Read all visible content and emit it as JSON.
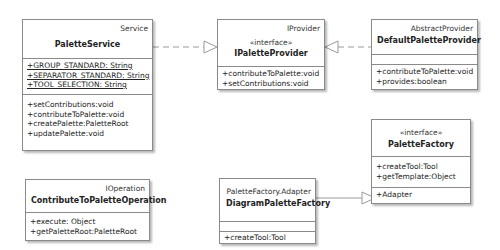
{
  "classes": {
    "palette_service": {
      "parent": "Service",
      "name": "PaletteService",
      "attributes": [
        "+GROUP_STANDARD: String",
        "+SEPARATOR_STANDARD: String",
        "+TOOL_SELECTION: String"
      ],
      "operations": [
        "+setContributions:void",
        "+contributeToPalette:void",
        "+createPalette:PaletteRoot",
        "+updatePalette:void"
      ]
    },
    "ipalette_provider": {
      "parent": "IProvider",
      "stereotype": "«interface»",
      "name": "IPaletteProvider",
      "operations": [
        "+contributeToPalette:void",
        "+setContributions:void"
      ]
    },
    "default_palette_provider": {
      "parent": "AbstractProvider",
      "name": "DefaultPaletteProvider",
      "operations": [
        "+contributeToPalette:void",
        "+provides:boolean"
      ]
    },
    "palette_factory": {
      "stereotype": "«interface»",
      "name": "PaletteFactory",
      "operations": [
        "+createTool:Tool",
        "+getTemplate:Object"
      ],
      "inner": [
        "+Adapter"
      ]
    },
    "contribute_op": {
      "parent": "IOperation",
      "name": "ContributeToPaletteOperation",
      "operations": [
        "+execute: Object",
        "+getPaletteRoot:PaletteRoot"
      ]
    },
    "diagram_palette_factory": {
      "parent": "PaletteFactory.Adapter",
      "name": "DiagramPaletteFactory",
      "operations": [
        "+createTool:Tool"
      ]
    }
  },
  "relations": [
    {
      "from": "PaletteService",
      "to": "IPaletteProvider",
      "type": "realization"
    },
    {
      "from": "DefaultPaletteProvider",
      "to": "IPaletteProvider",
      "type": "realization"
    },
    {
      "from": "DiagramPaletteFactory",
      "to": "PaletteFactory.Adapter",
      "type": "generalization"
    }
  ]
}
